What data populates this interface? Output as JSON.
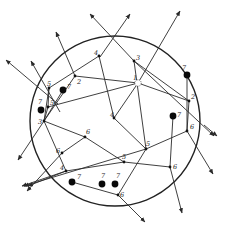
{
  "diagram": {
    "type": "network-in-circle",
    "boundary": {
      "cx": 115,
      "cy": 121,
      "r": 85
    },
    "colors": {
      "line": "#2a2a2a",
      "node": "#111111",
      "background": "#ffffff"
    },
    "nodes": [
      {
        "id": "n1",
        "label": "1",
        "x": 138,
        "y": 83,
        "style": "open",
        "lx": 133,
        "ly": 80
      },
      {
        "id": "n2a",
        "label": "2",
        "x": 75,
        "y": 76,
        "style": "small",
        "lx": 77,
        "ly": 84
      },
      {
        "id": "n2b",
        "label": "2",
        "x": 189,
        "y": 101,
        "style": "small",
        "lx": 191,
        "ly": 99
      },
      {
        "id": "n3a",
        "label": "3",
        "x": 134,
        "y": 61,
        "style": "small",
        "lx": 136,
        "ly": 60
      },
      {
        "id": "n3b",
        "label": "3",
        "x": 44,
        "y": 121,
        "style": "small",
        "lx": 38,
        "ly": 124
      },
      {
        "id": "n4a",
        "label": "4",
        "x": 99,
        "y": 56,
        "style": "small",
        "lx": 94,
        "ly": 55
      },
      {
        "id": "n4b",
        "label": "4",
        "x": 114,
        "y": 118,
        "style": "small",
        "lx": 110,
        "ly": 117
      },
      {
        "id": "n4c",
        "label": "4",
        "x": 66,
        "y": 171,
        "style": "small",
        "lx": 60,
        "ly": 170
      },
      {
        "id": "n5a",
        "label": "5",
        "x": 49,
        "y": 88,
        "style": "small",
        "lx": 47,
        "ly": 86
      },
      {
        "id": "n5b",
        "label": "5",
        "x": 48,
        "y": 107,
        "style": "small",
        "lx": 50,
        "ly": 105
      },
      {
        "id": "n5c",
        "label": "5",
        "x": 146,
        "y": 149,
        "style": "small",
        "lx": 146,
        "ly": 146
      },
      {
        "id": "n5d",
        "label": "5",
        "x": 124,
        "y": 162,
        "style": "small",
        "lx": 122,
        "ly": 159
      },
      {
        "id": "n6a",
        "label": "6",
        "x": 85,
        "y": 137,
        "style": "small",
        "lx": 86,
        "ly": 134
      },
      {
        "id": "n6b",
        "label": "6",
        "x": 62,
        "y": 153,
        "style": "small",
        "lx": 56,
        "ly": 153
      },
      {
        "id": "n6c",
        "label": "6",
        "x": 187,
        "y": 131,
        "style": "small",
        "lx": 190,
        "ly": 129
      },
      {
        "id": "n6d",
        "label": "6",
        "x": 170,
        "y": 167,
        "style": "small",
        "lx": 173,
        "ly": 169
      },
      {
        "id": "n6e",
        "label": "6",
        "x": 118,
        "y": 195,
        "style": "small",
        "lx": 120,
        "ly": 197
      },
      {
        "id": "b1",
        "label": "7",
        "x": 63,
        "y": 90,
        "style": "big",
        "lx": 67,
        "ly": 89
      },
      {
        "id": "b2",
        "label": "7",
        "x": 41,
        "y": 110,
        "style": "big",
        "lx": 38,
        "ly": 104
      },
      {
        "id": "b3",
        "label": "7",
        "x": 187,
        "y": 75,
        "style": "big",
        "lx": 182,
        "ly": 70
      },
      {
        "id": "b4",
        "label": "7",
        "x": 173,
        "y": 116,
        "style": "big",
        "lx": 177,
        "ly": 117
      },
      {
        "id": "b5",
        "label": "7",
        "x": 72,
        "y": 182,
        "style": "big",
        "lx": 77,
        "ly": 179
      },
      {
        "id": "b6",
        "label": "7",
        "x": 102,
        "y": 184,
        "style": "big",
        "lx": 101,
        "ly": 178
      },
      {
        "id": "b7",
        "label": "7",
        "x": 115,
        "y": 184,
        "style": "big",
        "lx": 116,
        "ly": 178
      }
    ],
    "edges": [
      [
        "n5a",
        "n4a"
      ],
      [
        "n5a",
        "n5b"
      ],
      [
        "n5a",
        "n3b"
      ],
      [
        "n2a",
        "n1"
      ],
      [
        "n2a",
        "n3b"
      ],
      [
        "n4a",
        "n4b"
      ],
      [
        "n3a",
        "n2b"
      ],
      [
        "n3a",
        "n5c"
      ],
      [
        "n1",
        "n2b"
      ],
      [
        "n1",
        "n4b"
      ],
      [
        "n4b",
        "n5c"
      ],
      [
        "n5c",
        "n6c"
      ],
      [
        "n6c",
        "n2b"
      ],
      [
        "n5b",
        "n3b"
      ],
      [
        "n5b",
        "n1"
      ],
      [
        "n3b",
        "n4c"
      ],
      [
        "n3b",
        "n6a"
      ],
      [
        "n6a",
        "n5d"
      ],
      [
        "n6a",
        "n6b"
      ],
      [
        "n5d",
        "n6d"
      ],
      [
        "n5d",
        "n4c"
      ],
      [
        "n6d",
        "b4"
      ],
      [
        "b1",
        "n3b"
      ],
      [
        "b5",
        "n6e"
      ],
      [
        "n5c",
        "n6e"
      ],
      [
        "b3",
        "n6c"
      ]
    ],
    "rays": [
      {
        "from": [
          58,
          104
        ],
        "to": [
          6,
          60
        ]
      },
      {
        "from": [
          60,
          112
        ],
        "to": [
          31,
          61
        ]
      },
      {
        "from": [
          75,
          76
        ],
        "to": [
          56,
          32
        ]
      },
      {
        "from": [
          100,
          57
        ],
        "to": [
          130,
          14
        ]
      },
      {
        "from": [
          134,
          61
        ],
        "to": [
          90,
          14
        ]
      },
      {
        "from": [
          138,
          83
        ],
        "to": [
          180,
          11
        ]
      },
      {
        "from": [
          134,
          61
        ],
        "to": [
          214,
          136
        ]
      },
      {
        "from": [
          187,
          131
        ],
        "to": [
          213,
          174
        ]
      },
      {
        "from": [
          204,
          125
        ],
        "to": [
          217,
          136
        ]
      },
      {
        "from": [
          170,
          167
        ],
        "to": [
          182,
          213
        ]
      },
      {
        "from": [
          118,
          195
        ],
        "to": [
          145,
          222
        ]
      },
      {
        "from": [
          66,
          171
        ],
        "to": [
          22,
          186
        ]
      },
      {
        "from": [
          62,
          153
        ],
        "to": [
          27,
          191
        ]
      },
      {
        "from": [
          44,
          121
        ],
        "to": [
          18,
          160
        ]
      },
      {
        "from": [
          66,
          171
        ],
        "to": [
          28,
          186
        ]
      },
      {
        "from": [
          146,
          149
        ],
        "to": [
          24,
          186
        ]
      }
    ],
    "labels_legend": [
      "1",
      "2",
      "3",
      "4",
      "5",
      "6",
      "7"
    ]
  }
}
